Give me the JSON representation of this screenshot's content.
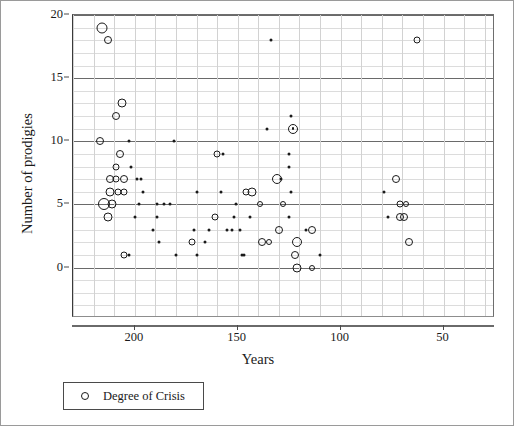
{
  "chart_data": {
    "type": "scatter",
    "title": "",
    "xlabel": "Years",
    "ylabel": "Number of prodigies",
    "xlim": [
      230,
      25
    ],
    "ylim": [
      -4,
      20
    ],
    "x_reversed": true,
    "xticks": [
      200,
      150,
      100,
      50
    ],
    "yticks": [
      0,
      5,
      10,
      15,
      20
    ],
    "grid": true,
    "legend": {
      "position": "below-axes-left",
      "entries": [
        {
          "label": "Degree of Crisis",
          "marker": "open-circle"
        }
      ]
    },
    "marker_note": "Marker area encodes Degree of Crisis; small filled dots = lowest degree, larger open circles = higher degree.",
    "series": [
      {
        "name": "Degree of Crisis",
        "points": [
          {
            "x": 216,
            "y": 19,
            "size": 11,
            "style": "ring"
          },
          {
            "x": 213,
            "y": 18,
            "size": 8,
            "style": "ring"
          },
          {
            "x": 206,
            "y": 13,
            "size": 9,
            "style": "ring"
          },
          {
            "x": 209,
            "y": 12,
            "size": 8,
            "style": "ring"
          },
          {
            "x": 217,
            "y": 10,
            "size": 8,
            "style": "ring"
          },
          {
            "x": 203,
            "y": 10,
            "size": 3,
            "style": "dot"
          },
          {
            "x": 181,
            "y": 10,
            "size": 3,
            "style": "dot"
          },
          {
            "x": 207,
            "y": 9,
            "size": 8,
            "style": "ring"
          },
          {
            "x": 209,
            "y": 8,
            "size": 7,
            "style": "ring"
          },
          {
            "x": 202,
            "y": 8,
            "size": 3,
            "style": "dot"
          },
          {
            "x": 212,
            "y": 7,
            "size": 8,
            "style": "ring"
          },
          {
            "x": 209,
            "y": 7,
            "size": 7,
            "style": "ring"
          },
          {
            "x": 205,
            "y": 7,
            "size": 8,
            "style": "ring"
          },
          {
            "x": 199,
            "y": 7,
            "size": 3,
            "style": "dot"
          },
          {
            "x": 197,
            "y": 7,
            "size": 3,
            "style": "dot"
          },
          {
            "x": 212,
            "y": 6,
            "size": 9,
            "style": "ring"
          },
          {
            "x": 208,
            "y": 6,
            "size": 7,
            "style": "ring"
          },
          {
            "x": 205,
            "y": 6,
            "size": 7,
            "style": "ring"
          },
          {
            "x": 196,
            "y": 6,
            "size": 3,
            "style": "dot"
          },
          {
            "x": 215,
            "y": 5,
            "size": 12,
            "style": "ring"
          },
          {
            "x": 211,
            "y": 5,
            "size": 9,
            "style": "ring"
          },
          {
            "x": 198,
            "y": 5,
            "size": 3,
            "style": "dot"
          },
          {
            "x": 213,
            "y": 4,
            "size": 9,
            "style": "ring"
          },
          {
            "x": 200,
            "y": 4,
            "size": 3,
            "style": "dot"
          },
          {
            "x": 205,
            "y": 1,
            "size": 7,
            "style": "ring"
          },
          {
            "x": 203,
            "y": 1,
            "size": 3,
            "style": "dot"
          },
          {
            "x": 189,
            "y": 5,
            "size": 3,
            "style": "dot"
          },
          {
            "x": 186,
            "y": 5,
            "size": 3,
            "style": "dot"
          },
          {
            "x": 183,
            "y": 5,
            "size": 3,
            "style": "dot"
          },
          {
            "x": 189,
            "y": 4,
            "size": 3,
            "style": "dot"
          },
          {
            "x": 191,
            "y": 3,
            "size": 3,
            "style": "dot"
          },
          {
            "x": 188,
            "y": 2,
            "size": 3,
            "style": "dot"
          },
          {
            "x": 180,
            "y": 1,
            "size": 3,
            "style": "dot"
          },
          {
            "x": 170,
            "y": 6,
            "size": 3,
            "style": "dot"
          },
          {
            "x": 171,
            "y": 3,
            "size": 3,
            "style": "dot"
          },
          {
            "x": 172,
            "y": 2,
            "size": 7,
            "style": "ring"
          },
          {
            "x": 170,
            "y": 1,
            "size": 3,
            "style": "dot"
          },
          {
            "x": 166,
            "y": 2,
            "size": 3,
            "style": "dot"
          },
          {
            "x": 164,
            "y": 3,
            "size": 3,
            "style": "dot"
          },
          {
            "x": 160,
            "y": 9,
            "size": 7,
            "style": "ring"
          },
          {
            "x": 157,
            "y": 9,
            "size": 3,
            "style": "dot"
          },
          {
            "x": 158,
            "y": 6,
            "size": 3,
            "style": "dot"
          },
          {
            "x": 161,
            "y": 4,
            "size": 7,
            "style": "ring"
          },
          {
            "x": 152,
            "y": 4,
            "size": 3,
            "style": "dot"
          },
          {
            "x": 155,
            "y": 3,
            "size": 3,
            "style": "dot"
          },
          {
            "x": 153,
            "y": 3,
            "size": 3,
            "style": "dot"
          },
          {
            "x": 151,
            "y": 5,
            "size": 3,
            "style": "dot"
          },
          {
            "x": 149,
            "y": 3,
            "size": 3,
            "style": "dot"
          },
          {
            "x": 148,
            "y": 1,
            "size": 3,
            "style": "dot"
          },
          {
            "x": 147,
            "y": 1,
            "size": 3,
            "style": "dot"
          },
          {
            "x": 146,
            "y": 6,
            "size": 7,
            "style": "ring"
          },
          {
            "x": 143,
            "y": 6,
            "size": 9,
            "style": "ring"
          },
          {
            "x": 144,
            "y": 4,
            "size": 3,
            "style": "dot"
          },
          {
            "x": 139,
            "y": 5,
            "size": 6,
            "style": "ring"
          },
          {
            "x": 138,
            "y": 2,
            "size": 8,
            "style": "ring"
          },
          {
            "x": 135,
            "y": 2,
            "size": 6,
            "style": "ring"
          },
          {
            "x": 134,
            "y": 18,
            "size": 3,
            "style": "dot"
          },
          {
            "x": 136,
            "y": 11,
            "size": 3,
            "style": "dot"
          },
          {
            "x": 131,
            "y": 7,
            "size": 10,
            "style": "ring"
          },
          {
            "x": 129,
            "y": 7,
            "size": 3,
            "style": "dot"
          },
          {
            "x": 130,
            "y": 3,
            "size": 8,
            "style": "ring"
          },
          {
            "x": 128,
            "y": 5,
            "size": 6,
            "style": "ring"
          },
          {
            "x": 124,
            "y": 12,
            "size": 3,
            "style": "dot"
          },
          {
            "x": 123,
            "y": 11,
            "size": 10,
            "style": "ring-dot"
          },
          {
            "x": 125,
            "y": 9,
            "size": 3,
            "style": "dot"
          },
          {
            "x": 125,
            "y": 8,
            "size": 3,
            "style": "dot"
          },
          {
            "x": 124,
            "y": 6,
            "size": 3,
            "style": "dot"
          },
          {
            "x": 125,
            "y": 4,
            "size": 3,
            "style": "dot"
          },
          {
            "x": 121,
            "y": 2,
            "size": 10,
            "style": "ring"
          },
          {
            "x": 122,
            "y": 1,
            "size": 8,
            "style": "ring"
          },
          {
            "x": 121,
            "y": 0,
            "size": 9,
            "style": "ring"
          },
          {
            "x": 117,
            "y": 3,
            "size": 3,
            "style": "dot"
          },
          {
            "x": 114,
            "y": 3,
            "size": 8,
            "style": "ring"
          },
          {
            "x": 114,
            "y": 0,
            "size": 6,
            "style": "ring"
          },
          {
            "x": 110,
            "y": 1,
            "size": 3,
            "style": "dot"
          },
          {
            "x": 63,
            "y": 18,
            "size": 7,
            "style": "ring"
          },
          {
            "x": 73,
            "y": 7,
            "size": 8,
            "style": "ring"
          },
          {
            "x": 79,
            "y": 6,
            "size": 3,
            "style": "dot"
          },
          {
            "x": 71,
            "y": 5,
            "size": 7,
            "style": "ring"
          },
          {
            "x": 68,
            "y": 5,
            "size": 6,
            "style": "ring"
          },
          {
            "x": 77,
            "y": 4,
            "size": 3,
            "style": "dot"
          },
          {
            "x": 71,
            "y": 4,
            "size": 8,
            "style": "ring"
          },
          {
            "x": 69,
            "y": 4,
            "size": 8,
            "style": "ring"
          },
          {
            "x": 67,
            "y": 2,
            "size": 8,
            "style": "ring"
          }
        ]
      }
    ]
  },
  "axes": {
    "y_title": "Number of prodigies",
    "x_title": "Years",
    "y_tick_labels": [
      "20",
      "15",
      "10",
      "5",
      "0"
    ],
    "x_tick_labels": [
      "200",
      "150",
      "100",
      "50"
    ]
  },
  "legend": {
    "label": "Degree of Crisis",
    "marker_name": "open-circle-marker"
  },
  "colors": {
    "point_stroke": "#1a1a1a",
    "grid_minor": "#d2d2d2",
    "grid_major": "#6a6a6a",
    "frame": "#6e6e6e",
    "outer_border": "#9a9a9a",
    "text": "#1a1a1a",
    "background": "#ffffff"
  }
}
